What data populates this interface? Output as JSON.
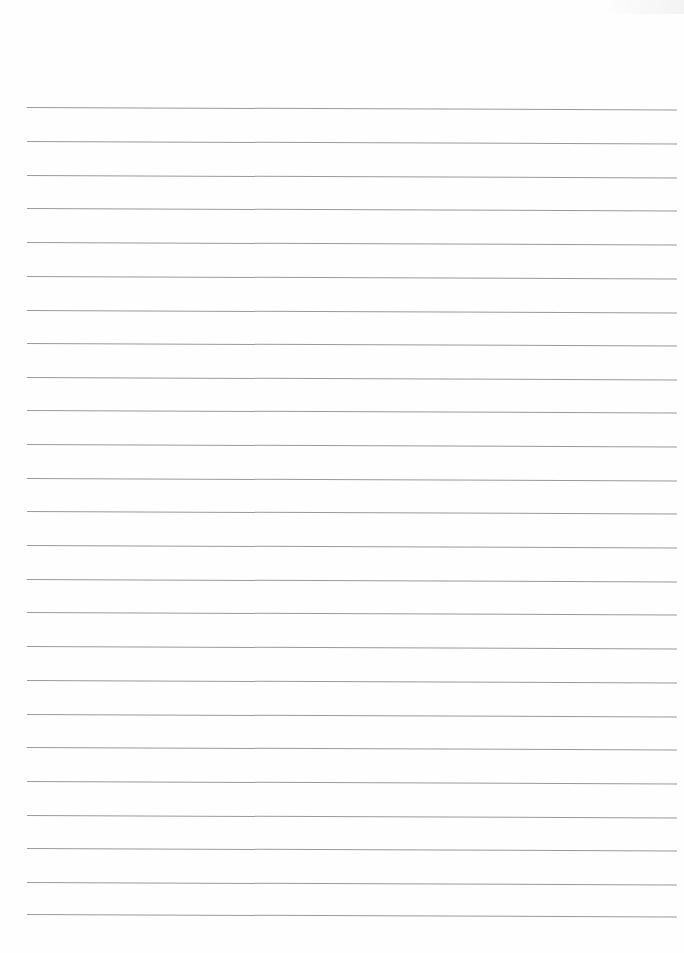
{
  "document": {
    "type": "lined-paper",
    "background_color": "#ffffff",
    "rule_color": "#8f8f8f",
    "rule_count": 25,
    "rules_y": [
      107,
      141,
      175,
      208,
      242,
      276,
      310,
      343,
      377,
      410,
      444,
      478,
      511,
      545,
      579,
      612,
      646,
      680,
      714,
      747,
      781,
      815,
      848,
      882,
      914
    ],
    "text": ""
  }
}
